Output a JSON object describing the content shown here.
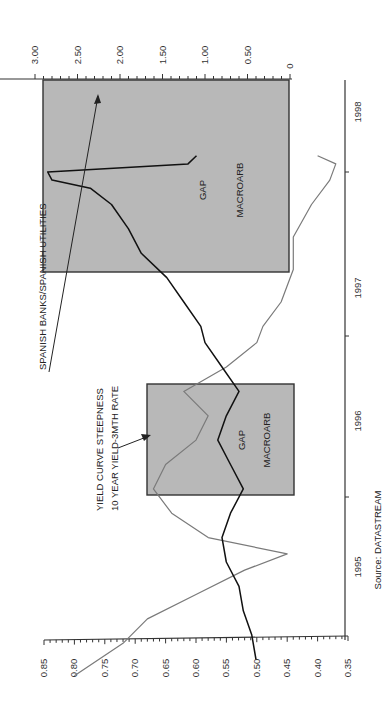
{
  "chart_data": {
    "type": "line",
    "orientation": "rotated-90-clockwise",
    "title": "",
    "source": "Source: DATASTREAM",
    "x_axis": {
      "label": "",
      "ticks": [
        "1995",
        "1996",
        "1997",
        "1998"
      ],
      "range": [
        1994.85,
        1998.15
      ]
    },
    "left_axis": {
      "label": "",
      "ticks": [
        "0.85",
        "0.80",
        "0.75",
        "0.70",
        "0.65",
        "0.60",
        "0.55",
        "0.50",
        "0.45",
        "0.40",
        "0.35"
      ],
      "range": [
        0.35,
        0.85
      ],
      "applies_to": "Yield curve steepness"
    },
    "right_axis": {
      "label": "",
      "ticks": [
        "3.00",
        "2.50",
        "2.00",
        "1.50",
        "1.00",
        "0.50",
        "0"
      ],
      "range": [
        0,
        3.0
      ],
      "applies_to": "Spanish banks/Spanish utilities"
    },
    "series": [
      {
        "name": "Spanish banks/Spanish utilities",
        "axis": "right",
        "color": "#111111",
        "x": [
          1995.0,
          1995.15,
          1995.3,
          1995.45,
          1995.6,
          1995.75,
          1995.9,
          1996.05,
          1996.2,
          1996.35,
          1996.5,
          1996.65,
          1996.8,
          1996.95,
          1997.05,
          1997.2,
          1997.35,
          1997.5,
          1997.65,
          1997.8,
          1997.9,
          1997.95,
          1998.0,
          1998.05,
          1998.1
        ],
        "values": [
          0.4,
          0.45,
          0.55,
          0.6,
          0.75,
          0.8,
          0.7,
          0.55,
          0.7,
          0.85,
          0.75,
          0.6,
          0.8,
          1.0,
          1.05,
          1.25,
          1.45,
          1.75,
          1.9,
          2.1,
          2.35,
          2.8,
          2.85,
          1.2,
          1.1
        ]
      },
      {
        "name": "Yield curve steepness (10 year yield - 3mth rate)",
        "axis": "left",
        "color": "#777777",
        "x": [
          1994.9,
          1995.1,
          1995.25,
          1995.4,
          1995.55,
          1995.65,
          1995.75,
          1995.9,
          1996.05,
          1996.2,
          1996.35,
          1996.5,
          1996.65,
          1996.8,
          1996.95,
          1997.05,
          1997.2,
          1997.4,
          1997.6,
          1997.8,
          1997.95,
          1998.05,
          1998.1
        ],
        "values": [
          0.8,
          0.72,
          0.68,
          0.6,
          0.52,
          0.45,
          0.58,
          0.64,
          0.67,
          0.65,
          0.6,
          0.58,
          0.62,
          0.55,
          0.5,
          0.49,
          0.46,
          0.44,
          0.44,
          0.41,
          0.38,
          0.37,
          0.4
        ]
      }
    ],
    "shaded_regions": [
      {
        "from": 1995.62,
        "to": 1996.4,
        "labels": [
          "GAP",
          "MACROARB"
        ]
      },
      {
        "from": 1997.1,
        "to": 1998.1,
        "labels": [
          "GAP",
          "MACROARB"
        ]
      }
    ],
    "annotations": [
      {
        "text": "SPANISH BANKS/SPANISH UTILITIES",
        "points_to": "Spanish banks/Spanish utilities"
      },
      {
        "text": "YIELD CURVE STEEPNESS",
        "points_to": "Yield curve steepness"
      },
      {
        "text": "10 YEAR YIELD-3MTH RATE",
        "points_to": "Yield curve steepness"
      }
    ],
    "grid": false,
    "legend": "none (inline annotations)"
  },
  "labels": {
    "source": "Source: DATASTREAM",
    "annot_banks": "SPANISH BANKS/SPANISH UTILITIES",
    "annot_yield_1": "YIELD CURVE STEEPNESS",
    "annot_yield_2": "10 YEAR YIELD-3MTH RATE",
    "box1_gap": "GAP",
    "box1_macro": "MACROARB",
    "box2_gap": "GAP",
    "box2_macro": "MACROARB",
    "year_1995": "1995",
    "year_1996": "1996",
    "year_1997": "1997",
    "year_1998": "1998",
    "left_ticks": [
      "0.85",
      "0.80",
      "0.75",
      "0.70",
      "0.65",
      "0.60",
      "0.55",
      "0.50",
      "0.45",
      "0.40",
      "0.35"
    ],
    "right_ticks": [
      "3.00",
      "2.50",
      "2.00",
      "1.50",
      "1.00",
      "0.50",
      "0"
    ]
  },
  "colors": {
    "shade": "#b8b8b8",
    "banks_line": "#111111",
    "yield_line": "#7a7a7a",
    "axis": "#333333"
  }
}
